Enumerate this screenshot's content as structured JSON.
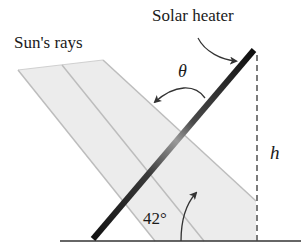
{
  "diagram": {
    "labels": {
      "sun_rays": "Sun's rays",
      "solar_heater": "Solar heater",
      "theta": "θ",
      "height": "h",
      "angle": "42°"
    },
    "colors": {
      "heater_dark": "#111111",
      "heater_light": "#8a8a8a",
      "ray_fill": "#ececec",
      "ray_line": "#bdbdbd",
      "ground": "#333333",
      "dashed": "#444444",
      "arrow": "#333333"
    },
    "geometry": {
      "heater_angle_deg": 42,
      "ground_y": 241
    }
  }
}
